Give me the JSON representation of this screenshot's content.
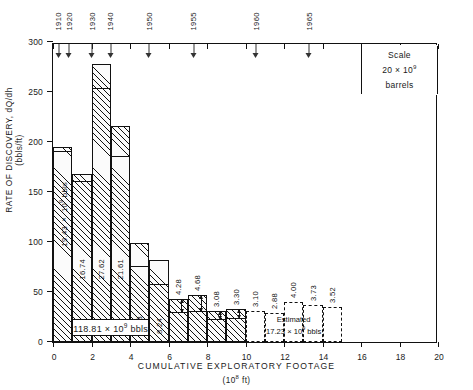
{
  "chart_data": {
    "type": "bar",
    "title": "",
    "xlabel": "CUMULATIVE  EXPLORATORY  FOOTAGE",
    "xunits": "(10⁸ ft)",
    "ylabel_line1": "RATE  OF  DISCOVERY,  dQ/dh",
    "ylabel_line2": "(bbls/ft)",
    "xlim": [
      0,
      20
    ],
    "ylim": [
      0,
      300
    ],
    "xticks": [
      0,
      2,
      4,
      6,
      8,
      10,
      12,
      14,
      16,
      18,
      20
    ],
    "yticks": [
      0,
      50,
      100,
      150,
      200,
      250,
      300
    ],
    "grid": false,
    "legend": null,
    "bin_width": 1,
    "bars": [
      {
        "x0": 0,
        "x1": 1,
        "top": 195,
        "inner": 190,
        "label": "19.43 × 10⁹ bbls",
        "estimated": false
      },
      {
        "x0": 1,
        "x1": 2,
        "top": 168,
        "inner": 160,
        "label": "16.74",
        "estimated": false
      },
      {
        "x0": 2,
        "x1": 3,
        "top": 278,
        "inner": 253,
        "label": "27.62",
        "estimated": false
      },
      {
        "x0": 3,
        "x1": 4,
        "top": 216,
        "inner": 185,
        "label": "21.61",
        "estimated": false
      },
      {
        "x0": 4,
        "x1": 5,
        "top": 99,
        "inner": 75,
        "label": "9.83",
        "estimated": false
      },
      {
        "x0": 5,
        "x1": 6,
        "top": 82,
        "inner": 57,
        "label": "8.24",
        "estimated": false
      },
      {
        "x0": 6,
        "x1": 7,
        "top": 43,
        "inner": 29,
        "label": "4.28",
        "estimated": false
      },
      {
        "x0": 7,
        "x1": 8,
        "top": 47,
        "inner": 30,
        "label": "4.68",
        "estimated": false
      },
      {
        "x0": 8,
        "x1": 9,
        "top": 31,
        "inner": 22,
        "label": "3.08",
        "estimated": false
      },
      {
        "x0": 9,
        "x1": 10,
        "top": 33,
        "inner": 23,
        "label": "3.30",
        "estimated": false
      },
      {
        "x0": 10,
        "x1": 11,
        "top": 31,
        "inner": null,
        "label": "3.10",
        "estimated": true
      },
      {
        "x0": 11,
        "x1": 12,
        "top": 29,
        "inner": null,
        "label": "2.88",
        "estimated": true
      },
      {
        "x0": 12,
        "x1": 13,
        "top": 40,
        "inner": null,
        "label": "4.00",
        "estimated": true
      },
      {
        "x0": 13,
        "x1": 14,
        "top": 37,
        "inner": null,
        "label": "3.73",
        "estimated": true
      },
      {
        "x0": 14,
        "x1": 15,
        "top": 35,
        "inner": null,
        "label": "3.52",
        "estimated": true
      }
    ],
    "year_markers": [
      {
        "year": "1910",
        "x": 0.3
      },
      {
        "year": "1920",
        "x": 0.85
      },
      {
        "year": "1930",
        "x": 2.05
      },
      {
        "year": "1940",
        "x": 3.0
      },
      {
        "year": "1950",
        "x": 5.0
      },
      {
        "year": "1955",
        "x": 7.3
      },
      {
        "year": "1960",
        "x": 10.55
      },
      {
        "year": "1965",
        "x": 13.3
      }
    ],
    "annotations": {
      "cumulative_box": "118.81 × 10⁹ bbls",
      "estimated_caption_line1": "Estimated",
      "estimated_caption_line2": "17.23 × 10⁹ bbls"
    }
  },
  "legend_box": {
    "title": "Scale",
    "value": "20 × 10⁹ barrels"
  }
}
